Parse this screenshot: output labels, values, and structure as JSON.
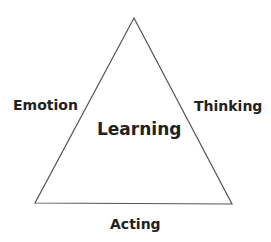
{
  "diagram": {
    "type": "triangle",
    "center_label": "Learning",
    "sides": {
      "left": "Emotion",
      "right": "Thinking",
      "bottom": "Acting"
    },
    "colors": {
      "line": "#555555",
      "text": "#222222",
      "background": "#ffffff"
    }
  }
}
